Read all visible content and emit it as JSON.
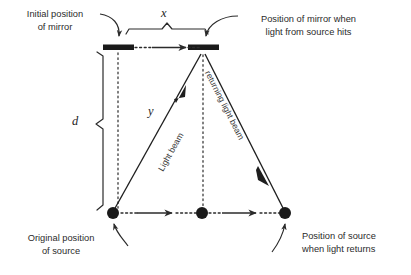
{
  "figure": {
    "background_color": "#ffffff",
    "ink_color": "#2b2b2b"
  },
  "labels": {
    "initial_mirror": {
      "line1": "Initial position",
      "line2": "of mirror"
    },
    "mirror_when_hit": {
      "line1": "Position of mirror when",
      "line2": "light from source hits"
    },
    "original_source": {
      "line1": "Original position",
      "line2": "of source"
    },
    "source_when_returns": {
      "line1": "Position of source",
      "line2": "when light returns"
    }
  },
  "variables": {
    "x": "x",
    "d": "d",
    "y": "y"
  },
  "beams": {
    "outgoing": "Light beam",
    "returning": "returning light beam"
  },
  "icon_names": {
    "mirror_bar": "mirror-bar-icon",
    "source_dot": "source-dot-icon",
    "motion_arrow": "motion-arrow-icon",
    "callout_arrow": "callout-curved-arrow-icon",
    "brace": "measurement-brace-icon",
    "dotted_guide": "dotted-guide-line-icon"
  },
  "geometry": {
    "mirror_left": {
      "x": 103,
      "y": 47,
      "width": 30,
      "height": 6
    },
    "mirror_right": {
      "x": 188,
      "y": 47,
      "width": 30,
      "height": 6
    },
    "source_left": {
      "x": 113,
      "y": 213,
      "r": 6
    },
    "source_middle": {
      "x": 202,
      "y": 213,
      "r": 6
    },
    "source_right": {
      "x": 285,
      "y": 213,
      "r": 6
    },
    "brace_x": {
      "from_x": 126,
      "to_x": 208,
      "y": 29
    },
    "brace_d": {
      "from_y": 52,
      "to_y": 209,
      "x": 103
    }
  }
}
